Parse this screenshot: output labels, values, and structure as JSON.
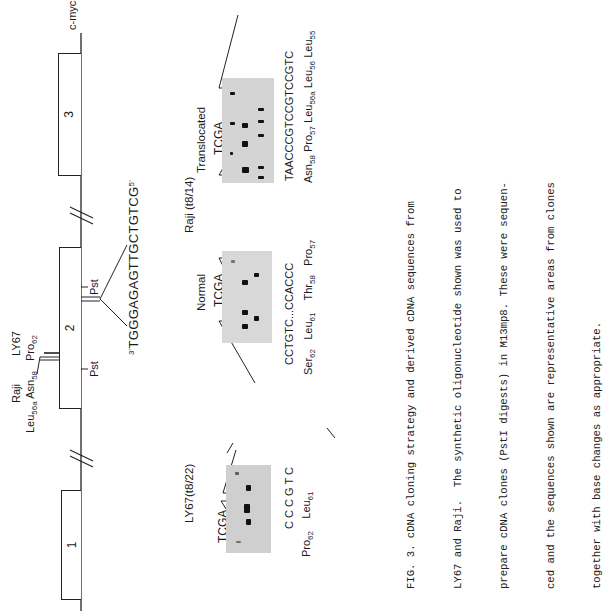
{
  "figure": {
    "gene_label": "c-myc",
    "exons": [
      {
        "number": "1"
      },
      {
        "number": "2"
      },
      {
        "number": "3"
      }
    ],
    "restriction_sites": [
      "Pst",
      "Pst"
    ],
    "oligonucleotide": {
      "prime3": "3'",
      "sequence": "TGGGAGAGTTGCTGTCG",
      "prime5": "5'"
    },
    "mutation_labels": {
      "raji": "Raji",
      "raji_sites": {
        "leu": "Leu",
        "leu_sub": "56",
        "leu_sup": "a",
        "asn": "Asn",
        "asn_sub": "58"
      },
      "ly67": "LY67",
      "ly67_sites": {
        "pro": "Pro",
        "pro_sub": "62"
      }
    },
    "panels": {
      "ly67": {
        "title": "LY67(t8/22)",
        "lanes": "TCGA",
        "sequence": [
          "C",
          "C",
          "C",
          "G",
          "T",
          "C"
        ],
        "annotations": [
          {
            "aa": "Pro",
            "num": "62"
          },
          {
            "aa": "Leu",
            "num": "61"
          }
        ]
      },
      "raji_group_title": "Raji (t8/14)",
      "normal": {
        "title": "Normal",
        "lanes": "TCGA",
        "sequence": [
          "C",
          "C",
          "T",
          "G",
          "T",
          "C",
          "...",
          "C",
          "C",
          "A",
          "C",
          "C",
          "C"
        ],
        "annotations": [
          {
            "aa": "Ser",
            "num": "62"
          },
          {
            "aa": "Leu",
            "num": "61"
          },
          {
            "aa": "Thr",
            "num": "58"
          },
          {
            "aa": "Pro",
            "num": "57"
          }
        ]
      },
      "translocated": {
        "title": "Translocated",
        "lanes": "TCGA",
        "sequence": [
          "T",
          "A",
          "A",
          "C",
          "C",
          "C",
          "G",
          "T",
          "C",
          "C",
          "G",
          "T",
          "C",
          "C",
          "G",
          "T",
          "C"
        ],
        "annotations": [
          {
            "aa": "Asn",
            "num": "58"
          },
          {
            "aa": "Pro",
            "num": "57"
          },
          {
            "aa": "Leu",
            "num": "56a"
          },
          {
            "aa": "Leu",
            "num": "56"
          },
          {
            "aa": "Leu",
            "num": "55"
          }
        ]
      }
    }
  },
  "caption": {
    "lines": [
      "FIG. 3. cDNA cloning strategy and derived cDNA sequences from",
      "LY67 and Raji.  The synthetic oligonucleotide shown was used to",
      "prepare cDNA clones (PstI digests) in M13mp8. These were sequen-",
      "ced and the sequences shown are representative areas from clones",
      "together with base changes as appropriate."
    ]
  }
}
